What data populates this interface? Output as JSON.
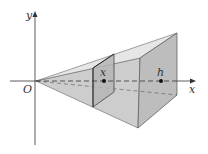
{
  "figure": {
    "labels": {
      "y_axis": "y",
      "x_axis": "x",
      "origin": "O",
      "cross_section": "x",
      "height": "h"
    },
    "colors": {
      "top_face": "#e4e4e4",
      "side_face": "#cfcfcf",
      "bottom_face": "#d6d6d6",
      "base_face": "#bdbdbd",
      "cross_section": "#b3b3b3",
      "edge": "#555555",
      "axis": "#333333"
    }
  }
}
